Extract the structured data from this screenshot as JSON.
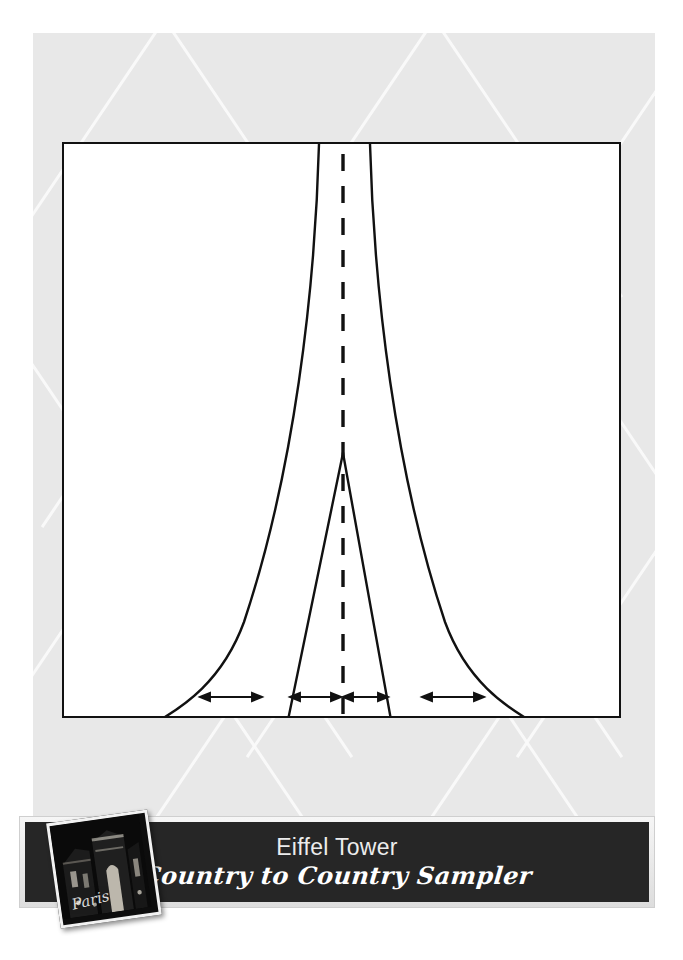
{
  "document": {
    "type": "quilt-block-pattern-sheet",
    "page_background_color": "#ffffff",
    "panel_background_color": "#e8e8e8",
    "pattern_frame": {
      "border_color": "#111111",
      "fill_color": "#ffffff",
      "x": 62,
      "y": 142,
      "width": 559,
      "height": 576
    }
  },
  "pattern": {
    "name": "eiffel-tower-block",
    "line_color": "#111111",
    "center_line_style": "dashed",
    "center_line_x": 342,
    "description": "Eiffel Tower silhouette drafting diagram: two outward-flaring leg curves, an inner narrow V shape, a dashed vertical centerline and four double-headed measurement arrows along the baseline.",
    "outer_left_curve": {
      "top_x": 317,
      "bottom_x": 158
    },
    "outer_right_curve": {
      "top_x": 368,
      "bottom_x": 527
    },
    "inner_v": {
      "apex_x": 342,
      "apex_y": 452,
      "left_bottom_x": 287,
      "right_bottom_x": 390
    },
    "arrows": [
      {
        "name": "left-outer-span",
        "x1": 200,
        "x2": 262,
        "y": 697,
        "heads": "both"
      },
      {
        "name": "inner-left-span",
        "x1": 290,
        "x2": 341,
        "y": 697,
        "heads": "both"
      },
      {
        "name": "inner-right-span",
        "x1": 343,
        "x2": 388,
        "y": 697,
        "heads": "both"
      },
      {
        "name": "right-outer-span",
        "x1": 422,
        "x2": 484,
        "y": 697,
        "heads": "both"
      }
    ]
  },
  "banner": {
    "background_color": "#262626",
    "frame_color": "#e6e6e6",
    "title": "Eiffel Tower",
    "subtitle": "Country to Country Sampler",
    "title_color": "#ececec",
    "subtitle_color": "#ffffff",
    "photo": {
      "name": "paris-night-photo",
      "caption": "Paris",
      "alt": "Night photo of a floodlit Paris monument with the handwritten word Paris",
      "rotation_deg": -8
    }
  }
}
